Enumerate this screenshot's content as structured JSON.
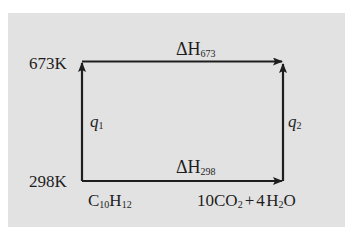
{
  "diagram": {
    "type": "thermochemical-cycle",
    "temperatures": {
      "high": "673K",
      "low": "298K"
    },
    "top_arrow": {
      "symbol": "ΔH",
      "subscript": "673"
    },
    "bottom_arrow": {
      "symbol": "ΔH",
      "subscript": "298"
    },
    "left_arrow": {
      "symbol": "q",
      "subscript": "1"
    },
    "right_arrow": {
      "symbol": "q",
      "subscript": "2"
    },
    "reactant": {
      "element1": "C",
      "sub1": "10",
      "element2": "H",
      "sub2": "12"
    },
    "products": {
      "coef1": "10",
      "mol1": "CO",
      "mol1_sub": "2",
      "plus": "+",
      "coef2": "4",
      "mol2a": "H",
      "mol2_sub": "2",
      "mol2b": "O"
    },
    "colors": {
      "panel": "#e2e2e2",
      "lines": "#1e1e1e"
    }
  }
}
